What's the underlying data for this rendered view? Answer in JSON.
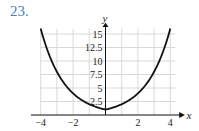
{
  "problem_number": "23.",
  "chart_data": {
    "type": "line",
    "title": "",
    "xlabel": "x",
    "ylabel": "y",
    "xlim": [
      -4,
      4
    ],
    "ylim": [
      0,
      16
    ],
    "grid": true,
    "x_ticks": [
      -4,
      -2,
      2,
      4
    ],
    "x_tick_labels": [
      "−4",
      "−2",
      "2",
      "4"
    ],
    "y_ticks": [
      2.5,
      5,
      7.5,
      10,
      12.5,
      15
    ],
    "y_tick_labels": [
      "2.5",
      "5",
      "7.5",
      "10",
      "12.5",
      "15"
    ],
    "series": [
      {
        "name": "y = 2^|x|",
        "x": [
          -4,
          -3,
          -2,
          -1,
          0,
          1,
          2,
          3,
          4
        ],
        "y": [
          16,
          8,
          4,
          2,
          1,
          2,
          4,
          8,
          16
        ]
      }
    ],
    "colors": {
      "curve": "#111111",
      "grid": "#cfcfcf",
      "number": "#4a7fb8"
    }
  }
}
